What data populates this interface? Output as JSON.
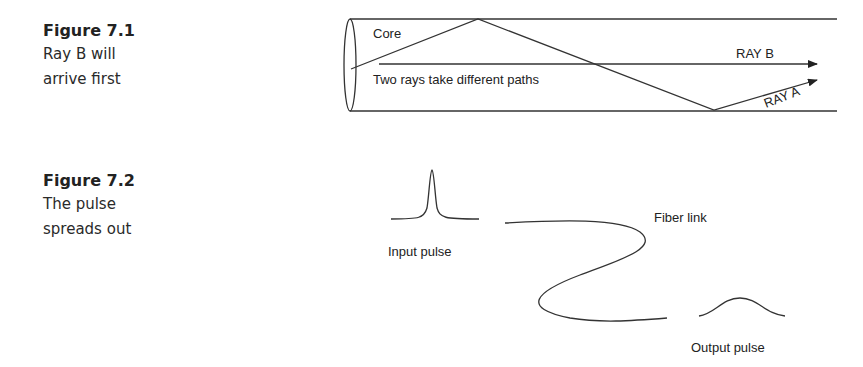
{
  "figures": [
    {
      "title": "Figure 7.1",
      "caption_lines": [
        "Ray B will",
        "arrive first"
      ],
      "diagram": {
        "labels": {
          "core": "Core",
          "note": "Two rays take different paths",
          "ray_b": "RAY B",
          "ray_a": "RAY A"
        }
      }
    },
    {
      "title": "Figure 7.2",
      "caption_lines": [
        "The pulse",
        "spreads out"
      ],
      "diagram": {
        "labels": {
          "input": "Input pulse",
          "fiber": "Fiber link",
          "output": "Output pulse"
        }
      }
    }
  ]
}
